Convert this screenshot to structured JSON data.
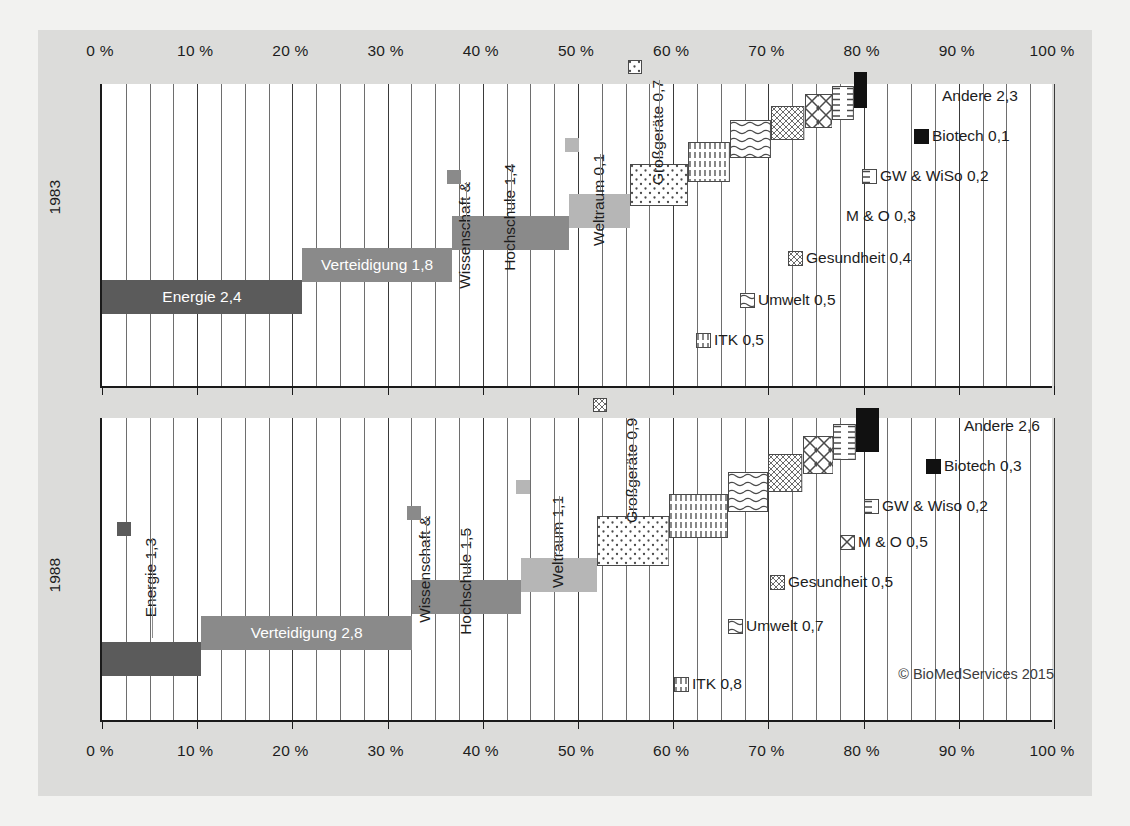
{
  "credit": "© BioMedServices 2015",
  "axis": {
    "ticks": [
      "0 %",
      "10 %",
      "20 %",
      "30 %",
      "40 %",
      "50 %",
      "60 %",
      "70 %",
      "80 %",
      "90 %",
      "100 %"
    ],
    "tick_values": [
      0,
      10,
      20,
      30,
      40,
      50,
      60,
      70,
      80,
      90,
      100
    ],
    "minor_step": 2.5,
    "min": 0,
    "max": 100
  },
  "years": {
    "top": "1983",
    "bottom": "1988"
  },
  "colors": {
    "energie": "#5b5b5b",
    "verteidigung": "#8a8a8a",
    "wissenschaft": "#8a8a8a",
    "weltraum": "#b6b6b6",
    "biotech": "#111111",
    "pattern_stroke": "#555555",
    "plot_bg": "#ffffff",
    "card_bg": "#dcdcda",
    "page_bg": "#f2f2f0",
    "axis": "#1a1a1a",
    "grid": "#6e6e6e"
  },
  "chart_data": {
    "type": "bar",
    "subtype": "waterfall-stacked-share",
    "title": "",
    "xlabel": "",
    "ylabel": "",
    "xlim": [
      0,
      100
    ],
    "grid": true,
    "legend": "inline-labels",
    "unit_note": "values are shares in percent of total; data labels are absolute values in Mrd. (billions)",
    "panels": [
      {
        "name": "1983",
        "year": "1983",
        "segments": [
          {
            "label": "Energie 2,4",
            "short": "Energie",
            "value": 2.4,
            "start": 0.0,
            "end": 21.0,
            "width": 21.0,
            "style": "solid-dark",
            "label_mode": "inside",
            "label_color": "#ffffff"
          },
          {
            "label": "Verteidigung 1,8",
            "short": "Verteidigung",
            "value": 1.8,
            "start": 21.0,
            "end": 36.8,
            "width": 15.8,
            "style": "solid-mid",
            "label_mode": "inside",
            "label_color": "#ffffff"
          },
          {
            "label": "Wissenschaft &",
            "short": "Wissenschaft",
            "value": null,
            "start": 36.8,
            "end": 36.8,
            "width": 0.0,
            "style": "solid-mid",
            "label_mode": "vertical-pair",
            "label_color": "#1d1d1d"
          },
          {
            "label": "Hochschule 1,4",
            "short": "Hochschule",
            "value": 1.4,
            "start": 36.8,
            "end": 49.1,
            "width": 12.3,
            "style": "solid-mid",
            "label_mode": "vertical",
            "label_color": "#1d1d1d"
          },
          {
            "label": "Weltraum 0,1",
            "short": "Weltraum",
            "value": 0.1,
            "start": 49.1,
            "end": 55.5,
            "width": 6.4,
            "style": "solid-light",
            "label_mode": "vertical",
            "label_color": "#1d1d1d"
          },
          {
            "label": "Großgeräte 0,7",
            "short": "Großgeräte",
            "value": 0.7,
            "start": 55.5,
            "end": 61.6,
            "width": 6.1,
            "style": "dots",
            "label_mode": "vertical",
            "label_color": "#1d1d1d"
          },
          {
            "label": "ITK 0,5",
            "short": "ITK",
            "value": 0.5,
            "start": 61.6,
            "end": 66.0,
            "width": 4.4,
            "style": "vdash",
            "label_mode": "leader",
            "label_color": "#1d1d1d"
          },
          {
            "label": "Umwelt 0,5",
            "short": "Umwelt",
            "value": 0.5,
            "start": 66.0,
            "end": 70.3,
            "width": 4.3,
            "style": "waves",
            "label_mode": "leader",
            "label_color": "#1d1d1d"
          },
          {
            "label": "Gesundheit 0,4",
            "short": "Gesundheit",
            "value": 0.4,
            "start": 70.3,
            "end": 73.8,
            "width": 3.5,
            "style": "fineweave",
            "label_mode": "leader",
            "label_color": "#1d1d1d"
          },
          {
            "label": "M & O 0,3",
            "short": "M & O",
            "value": 0.3,
            "start": 73.8,
            "end": 76.7,
            "width": 2.9,
            "style": "crosshatch",
            "label_mode": "leader",
            "label_color": "#1d1d1d"
          },
          {
            "label": "GW & WiSo 0,2",
            "short": "GW & WiSo",
            "value": 0.2,
            "start": 76.7,
            "end": 79.0,
            "width": 2.3,
            "style": "hdash",
            "label_mode": "leader",
            "label_color": "#1d1d1d"
          },
          {
            "label": "Biotech 0,1",
            "short": "Biotech",
            "value": 0.1,
            "start": 79.0,
            "end": 80.4,
            "width": 1.4,
            "style": "solid-black",
            "label_mode": "leader",
            "label_color": "#1d1d1d"
          },
          {
            "label": "Andere 2,3",
            "short": "Andere",
            "value": 2.3,
            "start": 80.4,
            "end": 80.4,
            "width": 0.0,
            "style": "none",
            "label_mode": "text-only",
            "label_color": "#1d1d1d"
          }
        ]
      },
      {
        "name": "1988",
        "year": "1988",
        "segments": [
          {
            "label": "Energie 1,3",
            "short": "Energie",
            "value": 1.3,
            "start": 0.0,
            "end": 10.4,
            "width": 10.4,
            "style": "solid-dark",
            "label_mode": "vertical",
            "label_color": "#1d1d1d"
          },
          {
            "label": "Verteidigung 2,8",
            "short": "Verteidigung",
            "value": 2.8,
            "start": 10.4,
            "end": 32.6,
            "width": 22.2,
            "style": "solid-mid",
            "label_mode": "inside",
            "label_color": "#ffffff"
          },
          {
            "label": "Wissenschaft &",
            "short": "Wissenschaft",
            "value": null,
            "start": 32.6,
            "end": 32.6,
            "width": 0.0,
            "style": "solid-mid",
            "label_mode": "vertical-pair",
            "label_color": "#1d1d1d"
          },
          {
            "label": "Hochschule 1,5",
            "short": "Hochschule",
            "value": 1.5,
            "start": 32.6,
            "end": 44.0,
            "width": 11.4,
            "style": "solid-mid",
            "label_mode": "vertical",
            "label_color": "#1d1d1d"
          },
          {
            "label": "Weltraum 1,1",
            "short": "Weltraum",
            "value": 1.1,
            "start": 44.0,
            "end": 52.0,
            "width": 8.0,
            "style": "solid-light",
            "label_mode": "vertical",
            "label_color": "#1d1d1d"
          },
          {
            "label": "Großgeräte 0,9",
            "short": "Großgeräte",
            "value": 0.9,
            "start": 52.0,
            "end": 59.6,
            "width": 7.6,
            "style": "dots",
            "label_mode": "vertical",
            "label_color": "#1d1d1d"
          },
          {
            "label": "ITK 0,8",
            "short": "ITK",
            "value": 0.8,
            "start": 59.6,
            "end": 65.8,
            "width": 6.2,
            "style": "vdash",
            "label_mode": "leader",
            "label_color": "#1d1d1d"
          },
          {
            "label": "Umwelt 0,7",
            "short": "Umwelt",
            "value": 0.7,
            "start": 65.8,
            "end": 70.0,
            "width": 4.2,
            "style": "waves",
            "label_mode": "leader",
            "label_color": "#1d1d1d"
          },
          {
            "label": "Gesundheit 0,5",
            "short": "Gesundheit",
            "value": 0.5,
            "start": 70.0,
            "end": 73.6,
            "width": 3.6,
            "style": "fineweave",
            "label_mode": "leader",
            "label_color": "#1d1d1d"
          },
          {
            "label": "M & O 0,5",
            "short": "M & O",
            "value": 0.5,
            "start": 73.6,
            "end": 76.8,
            "width": 3.2,
            "style": "crosshatch",
            "label_mode": "leader",
            "label_color": "#1d1d1d"
          },
          {
            "label": "GW & Wiso 0,2",
            "short": "GW & Wiso",
            "value": 0.2,
            "start": 76.8,
            "end": 79.2,
            "width": 2.4,
            "style": "hdash",
            "label_mode": "leader",
            "label_color": "#1d1d1d"
          },
          {
            "label": "Biotech 0,3",
            "short": "Biotech",
            "value": 0.3,
            "start": 79.2,
            "end": 81.6,
            "width": 2.4,
            "style": "solid-black",
            "label_mode": "leader",
            "label_color": "#1d1d1d"
          },
          {
            "label": "Andere 2,6",
            "short": "Andere",
            "value": 2.6,
            "start": 81.6,
            "end": 81.6,
            "width": 0.0,
            "style": "none",
            "label_mode": "text-only",
            "label_color": "#1d1d1d"
          }
        ]
      }
    ]
  }
}
